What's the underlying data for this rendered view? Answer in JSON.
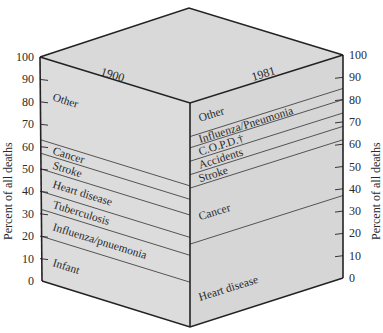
{
  "colors": {
    "face_left": "#dcdcdc",
    "face_right": "#d6d6d6",
    "face_top": "#d9d9d9",
    "edge": "#222222",
    "band_line": "#444444",
    "text": "#2a2a2a"
  },
  "left_axis": {
    "title": "Percent of all deaths",
    "ticks": [
      "0",
      "10",
      "20",
      "30",
      "40",
      "50",
      "60",
      "70",
      "80",
      "90",
      "100"
    ]
  },
  "right_axis": {
    "title": "Percent of all deaths",
    "ticks": [
      "0",
      "10",
      "20",
      "30",
      "40",
      "50",
      "60",
      "70",
      "80",
      "90",
      "100"
    ]
  },
  "faces": {
    "left": {
      "year": "1900",
      "bands": [
        {
          "label": "Infant",
          "from": 0,
          "to": 20
        },
        {
          "label": "Influenza/pnuemonia",
          "from": 20,
          "to": 32
        },
        {
          "label": "Tuberculosis",
          "from": 32,
          "to": 40
        },
        {
          "label": "Heart disease",
          "from": 40,
          "to": 50
        },
        {
          "label": "Stroke",
          "from": 50,
          "to": 57
        },
        {
          "label": "Cancer",
          "from": 57,
          "to": 63
        },
        {
          "label": "Other",
          "from": 63,
          "to": 100
        }
      ]
    },
    "right": {
      "year": "1981",
      "bands": [
        {
          "label": "Heart disease",
          "from": 0,
          "to": 37
        },
        {
          "label": "Cancer",
          "from": 37,
          "to": 62
        },
        {
          "label": "Stroke",
          "from": 62,
          "to": 68
        },
        {
          "label": "Accidents",
          "from": 68,
          "to": 74
        },
        {
          "label": "C.O.P.D.†",
          "from": 74,
          "to": 80
        },
        {
          "label": "Influenza/Pneumonia",
          "from": 80,
          "to": 85
        },
        {
          "label": "Other",
          "from": 85,
          "to": 100
        }
      ]
    }
  },
  "chart_data": {
    "type": "bar",
    "categories": [
      "1900",
      "1981"
    ],
    "ylabel": "Percent of all deaths",
    "xlabel": "",
    "ylim": [
      0,
      100
    ],
    "stacked": true,
    "series": [
      {
        "name": "Infant",
        "values": [
          20,
          0
        ]
      },
      {
        "name": "Influenza/pneumonia",
        "values": [
          12,
          5
        ]
      },
      {
        "name": "Tuberculosis",
        "values": [
          8,
          0
        ]
      },
      {
        "name": "Heart disease",
        "values": [
          10,
          37
        ]
      },
      {
        "name": "Stroke",
        "values": [
          7,
          6
        ]
      },
      {
        "name": "Cancer",
        "values": [
          6,
          25
        ]
      },
      {
        "name": "Accidents",
        "values": [
          0,
          6
        ]
      },
      {
        "name": "C.O.P.D.",
        "values": [
          0,
          6
        ]
      },
      {
        "name": "Other",
        "values": [
          37,
          15
        ]
      }
    ],
    "yticks": [
      0,
      10,
      20,
      30,
      40,
      50,
      60,
      70,
      80,
      90,
      100
    ],
    "grid": false,
    "legend_position": "inline labels on faces"
  }
}
